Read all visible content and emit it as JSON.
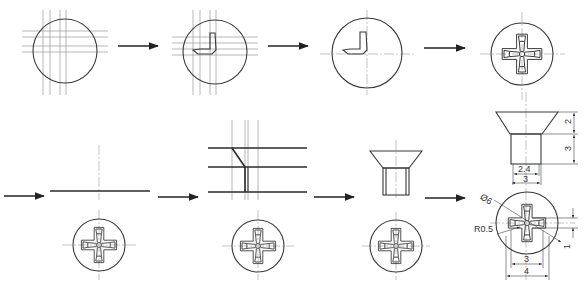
{
  "figure": {
    "steps": [
      {
        "id": 1,
        "view": "circle with construction lines"
      },
      {
        "id": 2,
        "view": "circle with first L-shaped recess arm"
      },
      {
        "id": 3,
        "view": "circle with L-shaped recess arm, construction removed"
      },
      {
        "id": 4,
        "view": "completed cross recess top view"
      },
      {
        "id": 5,
        "view": "side view baseline + top view"
      },
      {
        "id": 6,
        "view": "side view construction lines + top view"
      },
      {
        "id": 7,
        "view": "countersunk side view + top view"
      },
      {
        "id": 8,
        "view": "dimensioned side view + dimensioned top view"
      }
    ],
    "arrow_icon": "right-arrow"
  },
  "dimensions": {
    "side_view": {
      "head_height": "2",
      "shank_height": "3",
      "inner_width": "2.4",
      "shank_width": "3"
    },
    "top_view": {
      "diameter": "Ø6",
      "radius": "R0.5",
      "slot_width": "1",
      "cross_inner": "3",
      "cross_outer": "4"
    }
  }
}
